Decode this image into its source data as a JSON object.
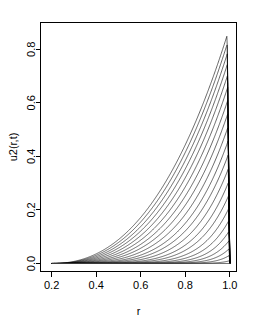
{
  "chart_data": {
    "type": "line",
    "title": "",
    "subtitle": "",
    "xlabel": "r",
    "ylabel": "u2(r,t)",
    "xlim": [
      0.15,
      1.03
    ],
    "ylim": [
      -0.03,
      0.9
    ],
    "xticks": [
      0.2,
      0.4,
      0.6,
      0.8,
      1.0
    ],
    "xtick_labels": [
      "0.2",
      "0.4",
      "0.6",
      "0.8",
      "1.0"
    ],
    "yticks": [
      0.0,
      0.2,
      0.4,
      0.6,
      0.8
    ],
    "ytick_labels": [
      "0.0",
      "0.2",
      "0.4",
      "0.6",
      "0.8"
    ],
    "grid": false,
    "legend": false,
    "legend_position": "none",
    "frame": "box",
    "series_count": 21,
    "line_color": "#000000",
    "background_color": "#ffffff",
    "x_domain_start": 0.2,
    "x_domain_end": 1.0,
    "series": [
      {
        "name": "t01",
        "peak_x": 0.998,
        "peak_value": 0.01,
        "sharpness": 160
      },
      {
        "name": "t02",
        "peak_x": 0.9975,
        "peak_value": 0.03,
        "sharpness": 120
      },
      {
        "name": "t03",
        "peak_x": 0.997,
        "peak_value": 0.055,
        "sharpness": 98
      },
      {
        "name": "t04",
        "peak_x": 0.9965,
        "peak_value": 0.085,
        "sharpness": 82
      },
      {
        "name": "t05",
        "peak_x": 0.996,
        "peak_value": 0.12,
        "sharpness": 70
      },
      {
        "name": "t06",
        "peak_x": 0.9955,
        "peak_value": 0.16,
        "sharpness": 60
      },
      {
        "name": "t07",
        "peak_x": 0.995,
        "peak_value": 0.205,
        "sharpness": 52
      },
      {
        "name": "t08",
        "peak_x": 0.9945,
        "peak_value": 0.253,
        "sharpness": 45
      },
      {
        "name": "t09",
        "peak_x": 0.994,
        "peak_value": 0.303,
        "sharpness": 40
      },
      {
        "name": "t10",
        "peak_x": 0.9935,
        "peak_value": 0.354,
        "sharpness": 35
      },
      {
        "name": "t11",
        "peak_x": 0.993,
        "peak_value": 0.406,
        "sharpness": 31
      },
      {
        "name": "t12",
        "peak_x": 0.9925,
        "peak_value": 0.458,
        "sharpness": 28
      },
      {
        "name": "t13",
        "peak_x": 0.992,
        "peak_value": 0.51,
        "sharpness": 25
      },
      {
        "name": "t14",
        "peak_x": 0.9915,
        "peak_value": 0.561,
        "sharpness": 22.5
      },
      {
        "name": "t15",
        "peak_x": 0.991,
        "peak_value": 0.61,
        "sharpness": 20.5
      },
      {
        "name": "t16",
        "peak_x": 0.9905,
        "peak_value": 0.658,
        "sharpness": 18.8
      },
      {
        "name": "t17",
        "peak_x": 0.99,
        "peak_value": 0.703,
        "sharpness": 17.3
      },
      {
        "name": "t18",
        "peak_x": 0.9895,
        "peak_value": 0.745,
        "sharpness": 16.0
      },
      {
        "name": "t19",
        "peak_x": 0.989,
        "peak_value": 0.784,
        "sharpness": 14.9
      },
      {
        "name": "t20",
        "peak_x": 0.9885,
        "peak_value": 0.82,
        "sharpness": 13.9
      },
      {
        "name": "t21",
        "peak_x": 0.988,
        "peak_value": 0.852,
        "sharpness": 13.0
      }
    ]
  }
}
